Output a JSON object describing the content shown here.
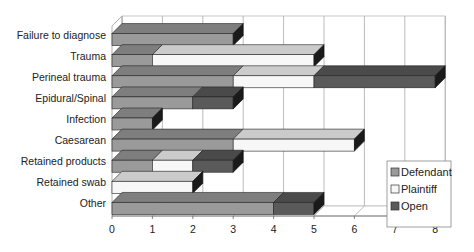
{
  "chart_data": {
    "type": "bar",
    "orientation": "horizontal",
    "stacked": true,
    "style": "3d",
    "title": "",
    "xlabel": "",
    "ylabel": "",
    "xlim": [
      0,
      8
    ],
    "x_ticks": [
      "0",
      "1",
      "2",
      "3",
      "4",
      "5",
      "6",
      "7",
      "8"
    ],
    "grid": true,
    "legend_position": "right-bottom",
    "categories": [
      "Failure to diagnose",
      "Trauma",
      "Perineal trauma",
      "Epidural/Spinal",
      "Infection",
      "Caesarean",
      "Retained products",
      "Retained swab",
      "Other"
    ],
    "series": [
      {
        "name": "Defendant",
        "color": "#9a9a9a",
        "values": [
          3,
          1,
          3,
          2,
          1,
          3,
          1,
          0,
          4
        ]
      },
      {
        "name": "Plaintiff",
        "color": "#f7f7f7",
        "values": [
          0,
          4,
          2,
          0,
          0,
          3,
          1,
          2,
          0
        ]
      },
      {
        "name": "Open",
        "color": "#5a5a5a",
        "values": [
          0,
          0,
          3,
          1,
          0,
          0,
          1,
          0,
          1
        ]
      }
    ]
  },
  "legend": {
    "items": [
      {
        "label": "Defendant",
        "color": "#9a9a9a"
      },
      {
        "label": "Plaintiff",
        "color": "#f7f7f7"
      },
      {
        "label": "Open",
        "color": "#5a5a5a"
      }
    ]
  }
}
